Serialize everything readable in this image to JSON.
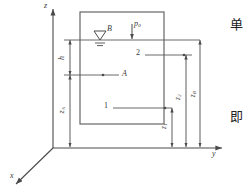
{
  "figure": {
    "background": "#ffffff",
    "line_color": "#4a4a4a",
    "text_color": "#3a3a3a"
  },
  "axes": {
    "z_label": "z",
    "y_label": "y",
    "x_label": "x",
    "origin_label": "O"
  },
  "container": {
    "name": "fluid-tank",
    "edge_color": "#555555"
  },
  "free_surface": {
    "symbol": "▽",
    "point_label": "B"
  },
  "pressure": {
    "label": "p",
    "subscript": "0"
  },
  "points": [
    {
      "id": "point-A",
      "label": "A"
    },
    {
      "id": "point-1",
      "label": "1"
    },
    {
      "id": "point-2",
      "label": "2"
    }
  ],
  "dimensions": [
    {
      "id": "dim-h",
      "label": "h",
      "subscript": ""
    },
    {
      "id": "dim-zA",
      "label": "z",
      "subscript": "A"
    },
    {
      "id": "dim-z1",
      "label": "z",
      "subscript": "1"
    },
    {
      "id": "dim-z2",
      "label": "z",
      "subscript": "2"
    },
    {
      "id": "dim-zB",
      "label": "z",
      "subscript": "B"
    }
  ],
  "margin_text": {
    "top": "单",
    "bottom": "即"
  }
}
